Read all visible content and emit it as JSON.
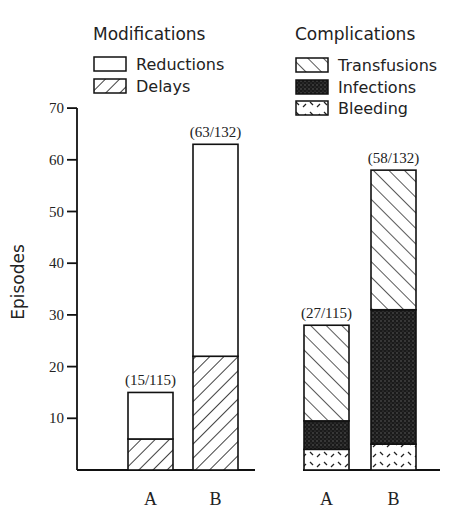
{
  "chart_data": {
    "type": "bar",
    "stacked": true,
    "ylabel": "Episodes",
    "ylim": [
      0,
      70
    ],
    "yticks": [
      10,
      20,
      30,
      40,
      50,
      60,
      70
    ],
    "grid": false,
    "panels": [
      {
        "title": "Modifications",
        "categories": [
          "A",
          "B"
        ],
        "annotations": [
          "(15/115)",
          "(63/132)"
        ],
        "series": [
          {
            "name": "Delays",
            "pattern": "backslash-hatch",
            "values": [
              6,
              22
            ]
          },
          {
            "name": "Reductions",
            "pattern": "open",
            "values": [
              9,
              41
            ]
          }
        ],
        "totals": [
          15,
          63
        ],
        "legend": [
          {
            "name": "Reductions",
            "pattern": "open"
          },
          {
            "name": "Delays",
            "pattern": "backslash-hatch"
          }
        ]
      },
      {
        "title": "Complications",
        "categories": [
          "A",
          "B"
        ],
        "annotations": [
          "(27/115)",
          "(58/132)"
        ],
        "series": [
          {
            "name": "Bleeding",
            "pattern": "dash-dots",
            "values": [
              4,
              5
            ]
          },
          {
            "name": "Infections",
            "pattern": "dark-stipple",
            "values": [
              5.5,
              26
            ]
          },
          {
            "name": "Transfusions",
            "pattern": "slash-hatch",
            "values": [
              18.5,
              27
            ]
          }
        ],
        "totals": [
          28,
          58
        ],
        "legend": [
          {
            "name": "Transfusions",
            "pattern": "slash-hatch"
          },
          {
            "name": "Infections",
            "pattern": "dark-stipple"
          },
          {
            "name": "Bleeding",
            "pattern": "dash-dots"
          }
        ]
      }
    ]
  },
  "layout": {
    "x0": 77,
    "y_zero": 470,
    "px_per_unit": 5.17,
    "bar_width": 45,
    "bar_x": [
      [
        128,
        193
      ],
      [
        304,
        371
      ]
    ],
    "baseline": [
      [
        77,
        255
      ],
      [
        303,
        440
      ]
    ]
  }
}
